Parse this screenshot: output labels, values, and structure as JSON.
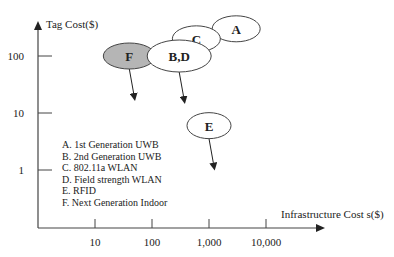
{
  "chart_data": {
    "type": "scatter",
    "title": "",
    "xlabel": "Infrastructure Cost s($)",
    "ylabel": "Tag Cost($)",
    "x_scale": "log",
    "y_scale": "log",
    "x_ticks": [
      "10",
      "100",
      "1,000",
      "10,000"
    ],
    "y_ticks": [
      "100",
      "10",
      "1"
    ],
    "points": [
      {
        "label": "A",
        "x": 3000,
        "y": 300,
        "arrow": false,
        "shaded": false
      },
      {
        "label": "C",
        "x": 600,
        "y": 200,
        "arrow": false,
        "shaded": false
      },
      {
        "label": "B,D",
        "x": 300,
        "y": 100,
        "arrow": true,
        "shaded": false
      },
      {
        "label": "F",
        "x": 40,
        "y": 100,
        "arrow": true,
        "shaded": true
      },
      {
        "label": "E",
        "x": 1000,
        "y": 6,
        "arrow": true,
        "shaded": false
      }
    ],
    "legend": [
      "A. 1st Generation UWB",
      "B. 2nd Generation UWB",
      "C. 802.11a WLAN",
      "D. Field strength WLAN",
      "E. RFID",
      "F. Next Generation Indoor"
    ],
    "legend_position": "lower-left",
    "grid": false
  }
}
